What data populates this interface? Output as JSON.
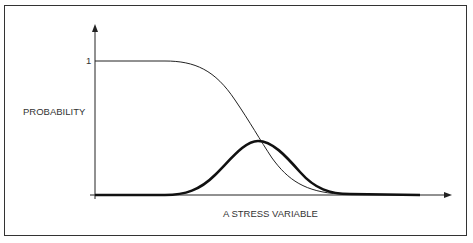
{
  "diagram": {
    "y_axis_label": "PROBABILITY",
    "y_tick_label": "1",
    "x_axis_label": "A STRESS VARIABLE",
    "curves": [
      {
        "name": "cumulative-survival-curve",
        "style": "thin",
        "description": "decreasing sigmoid from 1 to 0"
      },
      {
        "name": "probability-density-curve",
        "style": "thick",
        "description": "bell-shaped curve peaking near center"
      }
    ],
    "line_color": "#222222"
  }
}
